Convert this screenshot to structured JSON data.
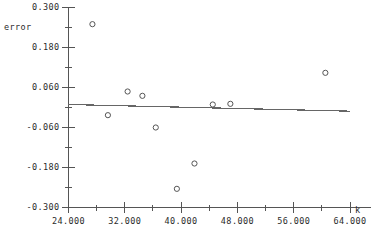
{
  "chart_data": {
    "type": "scatter",
    "title": "",
    "xlabel": "k",
    "ylabel": "error",
    "xlim": [
      24.0,
      64.0
    ],
    "ylim": [
      -0.3,
      0.3
    ],
    "grid": false,
    "legend": "none",
    "x_tick_labels": [
      "24.000",
      "32.000",
      "40.000",
      "48.000",
      "56.000",
      "64.000"
    ],
    "x_ticks": [
      24.0,
      32.0,
      40.0,
      48.0,
      56.0,
      64.0
    ],
    "x_minor_ticks": [
      28.0,
      36.0,
      44.0,
      52.0,
      60.0
    ],
    "y_tick_labels": [
      "0.300",
      "0.180",
      "0.060",
      "-0.060",
      "-0.180",
      "-0.300"
    ],
    "y_ticks": [
      0.3,
      0.18,
      0.06,
      -0.06,
      -0.18,
      -0.3
    ],
    "y_minor_ticks": [
      0.24,
      0.12,
      0.0,
      -0.12,
      -0.24
    ],
    "marker": "open-circle",
    "points": [
      {
        "x": 27.4,
        "y": 0.25
      },
      {
        "x": 29.6,
        "y": -0.023
      },
      {
        "x": 32.4,
        "y": 0.048
      },
      {
        "x": 34.5,
        "y": 0.035
      },
      {
        "x": 36.4,
        "y": -0.06
      },
      {
        "x": 39.4,
        "y": -0.244
      },
      {
        "x": 41.9,
        "y": -0.168
      },
      {
        "x": 44.5,
        "y": 0.009
      },
      {
        "x": 47.0,
        "y": 0.011
      },
      {
        "x": 60.5,
        "y": 0.104
      }
    ],
    "fit_line": {
      "type": "line",
      "x_start": 24.0,
      "y_start": 0.009,
      "x_end": 64.0,
      "y_end": -0.011
    }
  },
  "axes": {
    "y_axis_title": "error",
    "x_axis_title": "k"
  },
  "colors": {
    "axis": "#555555",
    "text": "#2b2b2b",
    "marker": "#555555",
    "fit_line": "#666666",
    "background": "#ffffff"
  }
}
